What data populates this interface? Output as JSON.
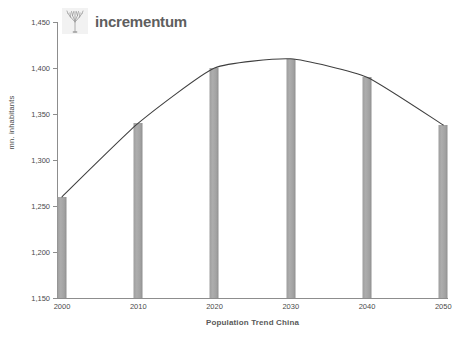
{
  "brand": {
    "name": "incrementum",
    "logo_icon": "tree-icon",
    "logo_color": "#8f8f8f"
  },
  "chart_data": {
    "type": "bar",
    "title": "",
    "xlabel": "Population Trend China",
    "ylabel": "mn. inhabitants",
    "categories": [
      "2000",
      "2010",
      "2020",
      "2030",
      "2040",
      "2050"
    ],
    "values": [
      1260,
      1340,
      1400,
      1410,
      1390,
      1338
    ],
    "series": [
      {
        "name": "Population",
        "type": "bar",
        "values": [
          1260,
          1340,
          1400,
          1410,
          1390,
          1338
        ]
      },
      {
        "name": "Trend",
        "type": "line",
        "values": [
          1260,
          1340,
          1400,
          1410,
          1390,
          1338
        ]
      }
    ],
    "ylim": [
      1150,
      1450
    ],
    "yticks": [
      1150,
      1200,
      1250,
      1300,
      1350,
      1400,
      1450
    ],
    "ytick_labels": [
      "1,150",
      "1,200",
      "1,250",
      "1,300",
      "1,350",
      "1,400",
      "1,450"
    ],
    "xtick_labels": [
      "2000",
      "2010",
      "2020",
      "2030",
      "2040",
      "2050"
    ],
    "grid": false,
    "legend": false,
    "legend_position": "none",
    "bar_color": "#a2a2a2",
    "line_color": "#3f3f3f",
    "axis_color": "#8d8d8d",
    "background": "#ffffff"
  }
}
